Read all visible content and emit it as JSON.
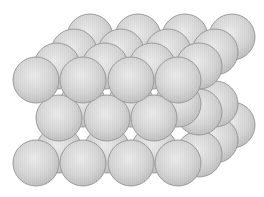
{
  "figure": {
    "background": "#ffffff",
    "sphere_radius": 23,
    "colors": {
      "fill_light": "#ececec",
      "fill_mid": "#d6d6d6",
      "fill_dark": "#bdbdbd",
      "outline": "#9a9a9a"
    },
    "spheres": [
      {
        "layer": "bottom-back",
        "x": 232,
        "y": 125
      },
      {
        "layer": "bottom-back",
        "x": 215,
        "y": 140
      },
      {
        "layer": "bottom-back",
        "x": 199,
        "y": 154
      },
      {
        "layer": "bottom-hidden",
        "x": 59,
        "y": 150
      },
      {
        "layer": "bottom-hidden",
        "x": 107,
        "y": 150
      },
      {
        "layer": "bottom-hidden",
        "x": 154,
        "y": 150
      },
      {
        "layer": "middle-back",
        "x": 215,
        "y": 104
      },
      {
        "layer": "middle-back",
        "x": 199,
        "y": 112
      },
      {
        "layer": "middle-hidden",
        "x": 83,
        "y": 104
      },
      {
        "layer": "middle-hidden",
        "x": 131,
        "y": 104
      },
      {
        "layer": "middle-hidden",
        "x": 178,
        "y": 104
      },
      {
        "layer": "middle-front",
        "x": 59,
        "y": 118
      },
      {
        "layer": "middle-front",
        "x": 107,
        "y": 118
      },
      {
        "layer": "middle-front",
        "x": 154,
        "y": 118
      },
      {
        "layer": "bottom-front",
        "x": 36,
        "y": 163
      },
      {
        "layer": "bottom-front",
        "x": 83,
        "y": 163
      },
      {
        "layer": "bottom-front",
        "x": 131,
        "y": 163
      },
      {
        "layer": "bottom-front",
        "x": 178,
        "y": 163
      },
      {
        "layer": "top-row-a",
        "x": 90,
        "y": 37
      },
      {
        "layer": "top-row-a",
        "x": 138,
        "y": 37
      },
      {
        "layer": "top-row-a",
        "x": 185,
        "y": 37
      },
      {
        "layer": "top-row-a",
        "x": 232,
        "y": 37
      },
      {
        "layer": "top-row-b",
        "x": 74,
        "y": 52
      },
      {
        "layer": "top-row-b",
        "x": 121,
        "y": 52
      },
      {
        "layer": "top-row-b",
        "x": 168,
        "y": 52
      },
      {
        "layer": "top-row-b",
        "x": 215,
        "y": 52
      },
      {
        "layer": "top-row-c",
        "x": 57,
        "y": 66
      },
      {
        "layer": "top-row-c",
        "x": 105,
        "y": 66
      },
      {
        "layer": "top-row-c",
        "x": 152,
        "y": 66
      },
      {
        "layer": "top-row-c",
        "x": 199,
        "y": 66
      },
      {
        "layer": "top-row-d",
        "x": 36,
        "y": 80
      },
      {
        "layer": "top-row-d",
        "x": 83,
        "y": 80
      },
      {
        "layer": "top-row-d",
        "x": 131,
        "y": 80
      },
      {
        "layer": "top-row-d",
        "x": 178,
        "y": 80
      }
    ]
  }
}
